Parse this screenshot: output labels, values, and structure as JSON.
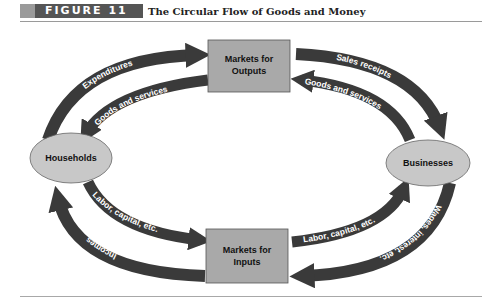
{
  "figure": {
    "badge": "FIGURE 11",
    "title": "The Circular Flow of Goods and Money"
  },
  "nodes": {
    "markets_outputs": {
      "line1": "Markets for",
      "line2": "Outputs"
    },
    "markets_inputs": {
      "line1": "Markets for",
      "line2": "Inputs"
    },
    "households": "Households",
    "businesses": "Businesses"
  },
  "flows": {
    "expenditures": "Expenditures",
    "goods_services_left": "Goods and services",
    "sales_receipts": "Sales receipts",
    "goods_services_right": "Goods and services",
    "labor_left": "Labor, capital, etc.",
    "incomes": "Incomes",
    "labor_right": "Labor, capital, etc.",
    "wages": "Wages, interest, etc."
  },
  "colors": {
    "arrow": "#3a3a3a",
    "box_fill": "#a9a9a9",
    "ellipse_fill": "#c8c8c8",
    "badge_bg": "#555555"
  }
}
